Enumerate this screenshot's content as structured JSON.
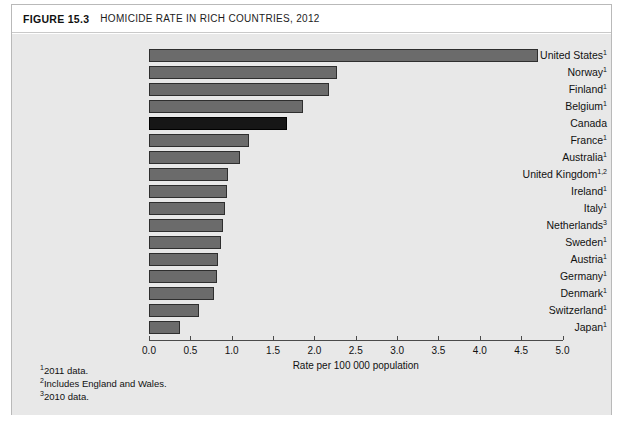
{
  "figure": {
    "number": "FIGURE 15.3",
    "title": "HOMICIDE RATE IN RICH COUNTRIES, 2012"
  },
  "footnotes": [
    {
      "marker": "1",
      "text": "2011 data."
    },
    {
      "marker": "2",
      "text": "Includes England and Wales."
    },
    {
      "marker": "3",
      "text": "2010 data."
    }
  ],
  "colors": {
    "bar": "#6b6b6b",
    "bar_highlight": "#161616",
    "panel": "#e8e8e8",
    "frame": "#b9b9b9",
    "axis": "#4a4a4a"
  },
  "chart_data": {
    "type": "bar",
    "orientation": "horizontal",
    "title": "HOMICIDE RATE IN RICH COUNTRIES, 2012",
    "xlabel": "Rate per 100 000 population",
    "ylabel": "",
    "xlim": [
      0.0,
      5.0
    ],
    "xticks": [
      "0.0",
      "0.5",
      "1.0",
      "1.5",
      "2.0",
      "2.5",
      "3.0",
      "3.5",
      "4.0",
      "4.5",
      "5.0"
    ],
    "xtick_values": [
      0.0,
      0.5,
      1.0,
      1.5,
      2.0,
      2.5,
      3.0,
      3.5,
      4.0,
      4.5,
      5.0
    ],
    "grid": false,
    "legend": false,
    "highlight_category": "Canada",
    "categories": [
      "United States",
      "Norway",
      "Finland",
      "Belgium",
      "Canada",
      "France",
      "Australia",
      "United Kingdom",
      "Ireland",
      "Italy",
      "Netherlands",
      "Sweden",
      "Austria",
      "Germany",
      "Denmark",
      "Switzerland",
      "Japan"
    ],
    "category_markers": [
      "1",
      "1",
      "1",
      "1",
      "",
      "1",
      "1",
      "1,2",
      "1",
      "1",
      "3",
      "1",
      "1",
      "1",
      "1",
      "1",
      "1"
    ],
    "values": [
      4.7,
      2.27,
      2.18,
      1.86,
      1.67,
      1.21,
      1.1,
      0.96,
      0.94,
      0.92,
      0.89,
      0.87,
      0.84,
      0.82,
      0.79,
      0.6,
      0.37
    ]
  }
}
